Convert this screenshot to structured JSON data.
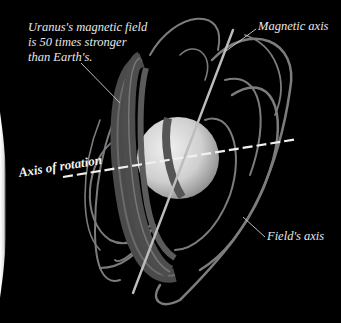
{
  "diagram": {
    "labels": {
      "field_strength_line1": "Uranus's magnetic field",
      "field_strength_line2": "is 50 times stronger",
      "field_strength_line3": "than Earth's.",
      "magnetic_axis": "Magnetic axis",
      "axis_of_rotation": "Axis of rotation",
      "fields_axis": "Field's axis"
    },
    "colors": {
      "background": "#000000",
      "planet": "#c8c8c8",
      "ring_band": "#5a5a5a",
      "field_line": "#8a8a8a",
      "axis_line": "#d8d8d8",
      "label_text": "#e8e8e8"
    }
  }
}
